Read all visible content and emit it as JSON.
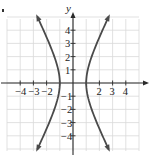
{
  "chart_data": {
    "type": "line",
    "title": "",
    "equation": "x^2 - y^2/4 = 1",
    "xlabel": "x",
    "ylabel": "y",
    "xlim": [
      -5,
      5
    ],
    "ylim": [
      -5,
      5
    ],
    "grid": true,
    "x_ticks": [
      -4,
      -3,
      -2,
      -1,
      1,
      2,
      3,
      4
    ],
    "y_ticks": [
      -4,
      -3,
      -2,
      -1,
      1,
      2,
      3,
      4
    ],
    "x_tick_labels": [
      "-4",
      "-3",
      "-2",
      "2",
      "3",
      "4"
    ],
    "y_tick_labels": [
      "4",
      "3",
      "2",
      "1",
      "-1",
      "-2",
      "-3",
      "-4"
    ],
    "vertices": [
      [
        -1,
        0
      ],
      [
        1,
        0
      ]
    ],
    "series": [
      {
        "name": "right branch",
        "points": [
          [
            2.69,
            -5
          ],
          [
            2.24,
            -4
          ],
          [
            1.8,
            -3
          ],
          [
            1.41,
            -2
          ],
          [
            1.12,
            -1
          ],
          [
            1,
            0
          ],
          [
            1.12,
            1
          ],
          [
            1.41,
            2
          ],
          [
            1.8,
            3
          ],
          [
            2.24,
            4
          ],
          [
            2.69,
            5
          ]
        ],
        "arrows": "both ends"
      },
      {
        "name": "left branch",
        "points": [
          [
            -2.69,
            -5
          ],
          [
            -2.24,
            -4
          ],
          [
            -1.8,
            -3
          ],
          [
            -1.41,
            -2
          ],
          [
            -1.12,
            -1
          ],
          [
            -1,
            0
          ],
          [
            -1.12,
            1
          ],
          [
            -1.41,
            2
          ],
          [
            -1.8,
            3
          ],
          [
            -2.24,
            4
          ],
          [
            -2.69,
            5
          ]
        ],
        "arrows": "both ends"
      }
    ],
    "colors": {
      "curve": "#4a4a4a",
      "axis": "#2a2a2a",
      "grid": "#d9d9d9"
    }
  },
  "layout": {
    "origin_px": [
      73,
      83
    ],
    "unit_px": 13.2
  }
}
